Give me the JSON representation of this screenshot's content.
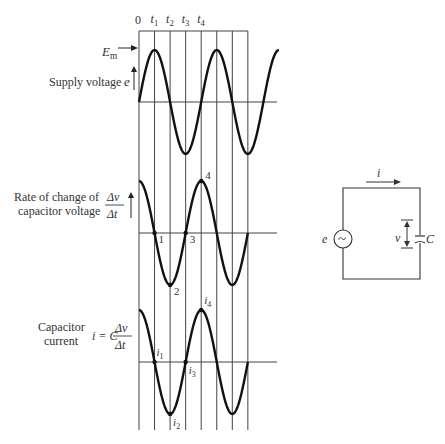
{
  "time_labels": [
    "0",
    "t",
    "t",
    "t",
    "t"
  ],
  "time_subscripts": [
    "",
    "1",
    "2",
    "3",
    "4"
  ],
  "panels": [
    {
      "id": "supply",
      "label_lines": [
        "Supply voltage"
      ],
      "symbol": "e",
      "peak_label": "E",
      "peak_label_sub": "m",
      "waveform": "sine",
      "cycles_shown": 2.25
    },
    {
      "id": "rate",
      "label_lines": [
        "Rate of change of",
        "capacitor voltage"
      ],
      "symbol_num": "Δv",
      "symbol_den": "Δt",
      "waveform": "cosine",
      "cycles_shown": 1.75,
      "point_labels": [
        "1",
        "2",
        "3",
        "4"
      ]
    },
    {
      "id": "current",
      "label_lines": [
        "Capacitor",
        "current"
      ],
      "formula_lhs": "i = C",
      "symbol_num": "Δv",
      "symbol_den": "Δt",
      "waveform": "cosine",
      "cycles_shown": 1.75,
      "point_labels": [
        "i",
        "i",
        "i",
        "i"
      ],
      "point_subs": [
        "1",
        "2",
        "3",
        "4"
      ]
    }
  ],
  "circuit": {
    "current_label": "i",
    "source_label": "e",
    "source_glyph": "~",
    "voltage_label": "v",
    "capacitor_label": "C"
  }
}
